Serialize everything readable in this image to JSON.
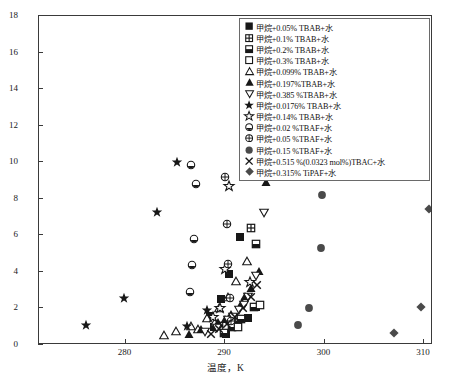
{
  "chart_data": {
    "type": "scatter",
    "title": "",
    "xlabel": "温度，K",
    "ylabel": "压力，MPa",
    "xlim": [
      271.3,
      310.9
    ],
    "ylim": [
      0,
      18
    ],
    "xticks": [
      280,
      290,
      300,
      310
    ],
    "yticks": [
      0,
      2,
      4,
      6,
      8,
      10,
      12,
      14,
      16,
      18
    ],
    "grid": false,
    "legend_position": "top-right",
    "series": [
      {
        "name": "甲烷+0.05% TBAB+水",
        "marker": "filled-square",
        "points": [
          [
            288.9,
            1.0
          ],
          [
            291.5,
            5.9
          ],
          [
            290.4,
            3.9
          ],
          [
            289.6,
            2.5
          ],
          [
            288.5,
            1.6
          ],
          [
            293.1,
            2.1
          ],
          [
            292.3,
            1.5
          ],
          [
            291.3,
            1.1
          ],
          [
            290.1,
            0.6
          ]
        ]
      },
      {
        "name": "甲烷+0.1% TBAB+水",
        "marker": "grid-square",
        "points": [
          [
            292.6,
            6.4
          ],
          [
            290.7,
            1.45
          ],
          [
            289.4,
            1.05
          ],
          [
            293.0,
            16.0
          ],
          [
            291.9,
            12.2
          ]
        ]
      },
      {
        "name": "甲烷+0.2% TBAB+水",
        "marker": "half-square",
        "points": [
          [
            293.1,
            5.55
          ],
          [
            292.9,
            2.1
          ],
          [
            293.4,
            15.5
          ],
          [
            291.6,
            1.45
          ],
          [
            290.7,
            1.0
          ],
          [
            289.9,
            0.65
          ]
        ]
      },
      {
        "name": "甲烷+0.3% TBAB+水",
        "marker": "open-square",
        "points": [
          [
            293.5,
            2.2
          ],
          [
            294.3,
            15.9
          ],
          [
            293.3,
            11.5
          ],
          [
            291.3,
            1.0
          ]
        ]
      },
      {
        "name": "甲烷+0.099% TBAB+水",
        "marker": "open-triangle-up",
        "points": [
          [
            291.1,
            3.5
          ],
          [
            290.3,
            2.6
          ],
          [
            289.4,
            2.05
          ],
          [
            288.2,
            1.5
          ],
          [
            286.6,
            1.05
          ],
          [
            285.1,
            0.75
          ],
          [
            283.9,
            0.55
          ],
          [
            292.2,
            4.6
          ],
          [
            289.0,
            1.25
          ],
          [
            287.3,
            0.85
          ]
        ]
      },
      {
        "name": "甲烷+0.197%TBAB+水",
        "marker": "filled-triangle-up",
        "points": [
          [
            293.4,
            4.05
          ],
          [
            292.6,
            3.1
          ],
          [
            291.7,
            2.35
          ],
          [
            290.6,
            1.7
          ],
          [
            289.3,
            1.25
          ],
          [
            287.6,
            0.85
          ],
          [
            286.4,
            0.6
          ],
          [
            294.1,
            8.9
          ],
          [
            292.0,
            2.7
          ],
          [
            290.0,
            1.45
          ]
        ]
      },
      {
        "name": "甲烷+0.385 %TBAB+水",
        "marker": "open-triangle-down",
        "points": [
          [
            293.9,
            7.2
          ],
          [
            293.1,
            3.8
          ],
          [
            292.3,
            2.6
          ],
          [
            291.4,
            1.9
          ],
          [
            290.3,
            1.35
          ],
          [
            289.2,
            0.95
          ],
          [
            288.0,
            0.7
          ],
          [
            294.4,
            11.5
          ],
          [
            291.9,
            2.2
          ],
          [
            290.8,
            1.55
          ]
        ]
      },
      {
        "name": "甲烷+0.0176% TBAB+水",
        "marker": "filled-star",
        "points": [
          [
            276.0,
            1.1
          ],
          [
            279.8,
            2.55
          ],
          [
            283.2,
            7.25
          ],
          [
            285.2,
            10.0
          ],
          [
            286.2,
            1.05
          ],
          [
            288.2,
            1.9
          ]
        ]
      },
      {
        "name": "甲烷+0.14% TBAB+水",
        "marker": "open-star",
        "points": [
          [
            292.5,
            3.45
          ],
          [
            290.4,
            8.7
          ],
          [
            289.5,
            2.05
          ],
          [
            288.8,
            1.55
          ],
          [
            290.0,
            4.15
          ]
        ]
      },
      {
        "name": "甲烷+0.02 %TBAF+水",
        "marker": "dot-circle",
        "points": [
          [
            286.6,
            9.85
          ],
          [
            287.1,
            8.8
          ],
          [
            286.9,
            5.8
          ],
          [
            286.7,
            4.35
          ],
          [
            286.5,
            2.9
          ]
        ]
      },
      {
        "name": "甲烷+0.05 %TBAF+水",
        "marker": "crossed-circle",
        "points": [
          [
            290.0,
            9.2
          ],
          [
            290.2,
            6.6
          ],
          [
            290.3,
            4.45
          ],
          [
            290.5,
            2.55
          ],
          [
            290.6,
            1.3
          ]
        ]
      },
      {
        "name": "甲烷+0.15 %TBAF+水",
        "marker": "filled-circle",
        "points": [
          [
            299.7,
            8.2
          ],
          [
            299.6,
            5.3
          ],
          [
            298.4,
            2.05
          ],
          [
            297.3,
            1.1
          ]
        ]
      },
      {
        "name": "甲烷+0.515 %(0.0323 mol%)TBAC+水",
        "marker": "cross-x",
        "points": [
          [
            292.6,
            2.6
          ],
          [
            291.8,
            2.0
          ],
          [
            291.0,
            1.55
          ],
          [
            290.2,
            1.15
          ],
          [
            289.4,
            0.85
          ],
          [
            288.6,
            0.6
          ],
          [
            293.2,
            3.3
          ]
        ]
      },
      {
        "name": "甲烷+0.315% TiPAF+水",
        "marker": "filled-diamond",
        "points": [
          [
            310.5,
            7.45
          ],
          [
            309.7,
            2.1
          ],
          [
            307.0,
            0.65
          ]
        ]
      }
    ]
  },
  "axes": {
    "ylabel": "压力，MPa",
    "xlabel": "温度，K",
    "yticks": [
      "0",
      "2",
      "4",
      "6",
      "8",
      "10",
      "12",
      "14",
      "16",
      "18"
    ],
    "xticks": [
      "280",
      "290",
      "300",
      "310"
    ]
  },
  "caption": ""
}
